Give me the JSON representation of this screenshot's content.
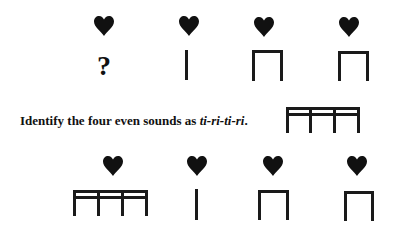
{
  "top_row": {
    "beats": [
      {
        "icon": "heart-icon",
        "notation": "?"
      },
      {
        "icon": "heart-icon",
        "notation": "ta"
      },
      {
        "icon": "heart-icon",
        "notation": "ti-ti"
      },
      {
        "icon": "heart-icon",
        "notation": "ti-ti"
      }
    ]
  },
  "instruction": {
    "prefix": "Identify the four even sounds as ",
    "syllables": "ti-ri-ti-ri",
    "suffix": ".",
    "example_notation": "ti-ri-ti-ri"
  },
  "bottom_row": {
    "beats": [
      {
        "icon": "heart-icon",
        "notation": "ti-ri-ti-ri"
      },
      {
        "icon": "heart-icon",
        "notation": "ta"
      },
      {
        "icon": "heart-icon",
        "notation": "ti-ti"
      },
      {
        "icon": "heart-icon",
        "notation": "ti-ti"
      }
    ]
  },
  "colors": {
    "ink": "#1a1a1a",
    "background": "#ffffff"
  }
}
